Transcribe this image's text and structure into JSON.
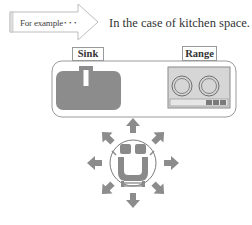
{
  "banner": {
    "arrow_label": "For example･･･",
    "heading": "In the case of kitchen space."
  },
  "kitchen": {
    "sink_label": "Sink",
    "range_label": "Range"
  },
  "robot": {
    "directions": [
      "up",
      "up-right",
      "right",
      "down-right",
      "down",
      "down-left",
      "left",
      "up-left"
    ]
  },
  "colors": {
    "fill_gray": "#8c8c8c",
    "panel_gray": "#d9d9d9",
    "outline": "#8a8a8a"
  }
}
